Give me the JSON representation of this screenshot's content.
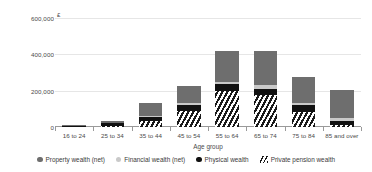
{
  "chart_data": {
    "type": "bar",
    "subtype": "stacked",
    "title": "",
    "xlabel": "Age group",
    "ylabel": "",
    "currency_symbol": "£",
    "categories": [
      "16 to 24",
      "25 to 34",
      "35 to 44",
      "45 to 54",
      "55 to 64",
      "65 to 74",
      "75 to 84",
      "85 and over"
    ],
    "ylim": [
      0,
      600000
    ],
    "yticks": [
      0,
      200000,
      400000,
      600000
    ],
    "ytick_labels": [
      "0",
      "200,000",
      "400,000",
      "600,000"
    ],
    "grid": true,
    "legend_position": "bottom",
    "stack_order_bottom_to_top": [
      "Private pension wealth",
      "Physical wealth",
      "Financial wealth (net)",
      "Property wealth (net)"
    ],
    "series": [
      {
        "name": "Private pension wealth",
        "marker": "hatch",
        "color": "#1a1a1a",
        "values": [
          2000,
          8000,
          33000,
          88000,
          200000,
          175000,
          85000,
          13000
        ]
      },
      {
        "name": "Physical wealth",
        "marker": "dot",
        "color": "#111111",
        "values": [
          5000,
          12000,
          22000,
          32000,
          35000,
          35000,
          35000,
          20000
        ]
      },
      {
        "name": "Financial wealth (net)",
        "marker": "dot",
        "color": "#c9c9c9",
        "values": [
          1000,
          2000,
          5000,
          10000,
          12000,
          22000,
          15000,
          18000
        ]
      },
      {
        "name": "Property wealth (net)",
        "marker": "dot",
        "color": "#6e6e6e",
        "values": [
          2000,
          13000,
          72000,
          95000,
          170000,
          185000,
          140000,
          155000
        ]
      }
    ],
    "totals": [
      10000,
      35000,
      132000,
      225000,
      417000,
      417000,
      275000,
      206000
    ]
  },
  "legend": {
    "items": [
      {
        "label": "Property wealth (net)",
        "swatch": "dot-dark-gray"
      },
      {
        "label": "Financial wealth (net)",
        "swatch": "dot-light-gray"
      },
      {
        "label": "Physical wealth",
        "swatch": "dot-black"
      },
      {
        "label": "Private pension wealth",
        "swatch": "hatch"
      }
    ]
  },
  "colors": {
    "property": "#6e6e6e",
    "financial": "#c9c9c9",
    "physical": "#111111",
    "pension": "#1a1a1a",
    "grid": "#e6e6e6",
    "axis": "#9a9a9a",
    "text": "#3a3a3a",
    "background": "#ffffff"
  }
}
